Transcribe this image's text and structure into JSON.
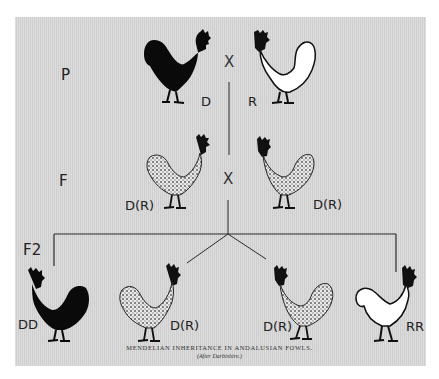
{
  "figure": {
    "caption": "MENDELIAN INHERITANCE IN ANDALUSIAN FOWLS.",
    "credit": "(After Darbishire.)",
    "cross_symbol": "X",
    "generations": [
      {
        "label": "P",
        "individuals": [
          {
            "genotype": "D",
            "phenotype": "black"
          },
          {
            "genotype": "R",
            "phenotype": "white"
          }
        ]
      },
      {
        "label": "F",
        "individuals": [
          {
            "genotype": "D(R)",
            "phenotype": "blue/speckled"
          },
          {
            "genotype": "D(R)",
            "phenotype": "blue/speckled"
          }
        ]
      },
      {
        "label": "F2",
        "individuals": [
          {
            "genotype": "DD",
            "phenotype": "black"
          },
          {
            "genotype": "D(R)",
            "phenotype": "blue/speckled"
          },
          {
            "genotype": "D(R)",
            "phenotype": "blue/speckled"
          },
          {
            "genotype": "RR",
            "phenotype": "white"
          }
        ]
      }
    ],
    "colors": {
      "background": "#d6d6d6",
      "black_bird": "#0a0a0a",
      "white_bird": "#ffffff",
      "comb": "#111111",
      "line": "#2a2a2a"
    }
  }
}
